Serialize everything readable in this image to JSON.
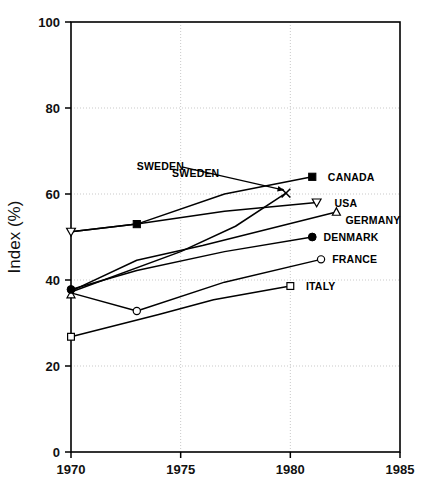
{
  "chart_data": {
    "type": "line",
    "title": "",
    "xlabel": "",
    "ylabel": "Index (%)",
    "xlim": [
      1970,
      1985
    ],
    "ylim": [
      0,
      100
    ],
    "xticks": [
      "1970",
      "1975",
      "1980",
      "1985"
    ],
    "xtick_values": [
      1970,
      1975,
      1980,
      1985
    ],
    "yticks": [
      "0",
      "20",
      "40",
      "60",
      "80",
      "100"
    ],
    "ytick_values": [
      0,
      20,
      40,
      60,
      80,
      100
    ],
    "grid": "dotted gridlines at y = 20, 40, 60, 80 and x = 1975, 1980",
    "legend": "inline end-of-line labels at right",
    "annotations": [
      {
        "text": "SWEDEN",
        "points_to_series": "Sweden",
        "points_to_x": 1979.8,
        "points_to_y": 60.2
      }
    ],
    "series": [
      {
        "name": "CANADA",
        "marker": "filled-square",
        "label_x": 1981.3,
        "label_y": 64.0,
        "points": [
          {
            "x": 1970,
            "y": 51.2
          },
          {
            "x": 1973,
            "y": 53.0
          },
          {
            "x": 1977,
            "y": 60.0
          },
          {
            "x": 1981,
            "y": 64.0
          }
        ]
      },
      {
        "name": "SWEDEN",
        "marker": "x-cross",
        "label_x": 1974.2,
        "label_y": 65.0,
        "points": [
          {
            "x": 1970,
            "y": 37.2
          },
          {
            "x": 1975,
            "y": 46.6
          },
          {
            "x": 1977.5,
            "y": 52.5
          },
          {
            "x": 1979.8,
            "y": 60.2
          }
        ]
      },
      {
        "name": "USA",
        "marker": "open-triangle-down",
        "label_x": 1981.6,
        "label_y": 58.0,
        "points": [
          {
            "x": 1970,
            "y": 51.2
          },
          {
            "x": 1973,
            "y": 53.0
          },
          {
            "x": 1977,
            "y": 56.0
          },
          {
            "x": 1981.2,
            "y": 58.0
          }
        ]
      },
      {
        "name": "GERMANY",
        "marker": "open-triangle-up",
        "label_x": 1982.1,
        "label_y": 54.0,
        "points": [
          {
            "x": 1970,
            "y": 37.4
          },
          {
            "x": 1973,
            "y": 44.6
          },
          {
            "x": 1976,
            "y": 48.0
          },
          {
            "x": 1982.1,
            "y": 55.8
          }
        ]
      },
      {
        "name": "DENMARK",
        "marker": "filled-circle",
        "label_x": 1981.1,
        "label_y": 50.0,
        "points": [
          {
            "x": 1970,
            "y": 37.8
          },
          {
            "x": 1973,
            "y": 42.2
          },
          {
            "x": 1977,
            "y": 46.6
          },
          {
            "x": 1981,
            "y": 50.0
          }
        ]
      },
      {
        "name": "FRANCE",
        "marker": "open-circle",
        "label_x": 1981.5,
        "label_y": 44.8,
        "points": [
          {
            "x": 1970,
            "y": 37.0
          },
          {
            "x": 1973,
            "y": 32.8
          },
          {
            "x": 1977,
            "y": 39.5
          },
          {
            "x": 1981.4,
            "y": 44.8
          }
        ]
      },
      {
        "name": "ITALY",
        "marker": "open-square",
        "label_x": 1980.3,
        "label_y": 38.6,
        "points": [
          {
            "x": 1970,
            "y": 26.8
          },
          {
            "x": 1974,
            "y": 32.0
          },
          {
            "x": 1976.5,
            "y": 35.4
          },
          {
            "x": 1980,
            "y": 38.6
          }
        ]
      }
    ]
  },
  "axes": {
    "y_title": "Index (%)",
    "y_tick_0": "0",
    "y_tick_20": "20",
    "y_tick_40": "40",
    "y_tick_60": "60",
    "y_tick_80": "80",
    "y_tick_100": "100",
    "x_tick_1970": "1970",
    "x_tick_1975": "1975",
    "x_tick_1980": "1980",
    "x_tick_1985": "1985"
  },
  "labels": {
    "sweden": "SWEDEN",
    "canada": "CANADA",
    "usa": "USA",
    "germany": "GERMANY",
    "denmark": "DENMARK",
    "france": "FRANCE",
    "italy": "ITALY"
  },
  "colors": {
    "ink": "#000000",
    "grid": "#c9c9c9",
    "background": "#ffffff"
  }
}
